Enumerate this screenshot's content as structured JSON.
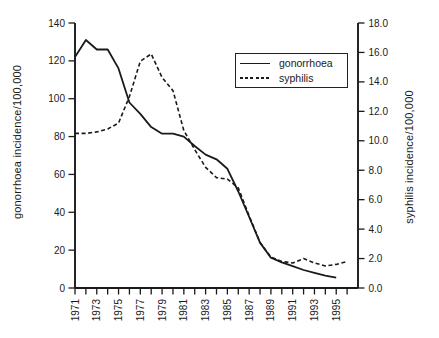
{
  "figure": {
    "background": "#ffffff",
    "line_color": "#1a1a1a"
  },
  "chart_data": {
    "type": "line",
    "title": "",
    "xlabel": "",
    "ylabel_left": "gonorrhoea incidence/100,000",
    "ylabel_right": "syphilis incidence/100,000",
    "grid": false,
    "legend_position": "upper-right-inside",
    "x_axis": {
      "labeled_ticks": [
        "1971",
        "1973",
        "1975",
        "1977",
        "1979",
        "1981",
        "1983",
        "1985",
        "1987",
        "1989",
        "1991",
        "1993",
        "1995"
      ],
      "minor_tick_step_years": 1,
      "range": [
        1971,
        1997
      ]
    },
    "left_axis": {
      "ticks": [
        "0",
        "20",
        "40",
        "60",
        "80",
        "100",
        "120",
        "140"
      ],
      "lim": [
        0,
        140
      ]
    },
    "right_axis": {
      "ticks": [
        "0.0",
        "2.0",
        "4.0",
        "6.0",
        "8.0",
        "10.0",
        "12.0",
        "14.0",
        "16.0",
        "18.0"
      ],
      "lim": [
        0,
        18
      ]
    },
    "series": [
      {
        "name": "gonorrhoea",
        "axis": "left",
        "line_style": "solid",
        "color": "#1a1a1a",
        "x": [
          1971,
          1972,
          1973,
          1974,
          1975,
          1976,
          1977,
          1978,
          1979,
          1980,
          1981,
          1982,
          1983,
          1984,
          1985,
          1986,
          1987,
          1988,
          1989,
          1990,
          1991,
          1992,
          1993,
          1994,
          1995
        ],
        "values": [
          122,
          131,
          126,
          126,
          116,
          98,
          92,
          85,
          81.5,
          81.5,
          80,
          75,
          70.5,
          68,
          63,
          51,
          37.5,
          24,
          16,
          13.5,
          11.5,
          9.5,
          8,
          6.5,
          5.5
        ]
      },
      {
        "name": "syphilis",
        "axis": "right",
        "line_style": "dashed",
        "color": "#1a1a1a",
        "x": [
          1971,
          1972,
          1973,
          1974,
          1975,
          1976,
          1977,
          1978,
          1979,
          1980,
          1981,
          1982,
          1983,
          1984,
          1985,
          1986,
          1987,
          1988,
          1989,
          1990,
          1991,
          1992,
          1993,
          1994,
          1995,
          1996
        ],
        "values": [
          10.5,
          10.5,
          10.6,
          10.8,
          11.2,
          13.0,
          15.4,
          15.9,
          14.3,
          13.4,
          10.7,
          9.4,
          8.2,
          7.5,
          7.4,
          6.8,
          4.9,
          3.1,
          2.1,
          1.8,
          1.7,
          2.0,
          1.7,
          1.5,
          1.6,
          1.8
        ]
      }
    ]
  }
}
